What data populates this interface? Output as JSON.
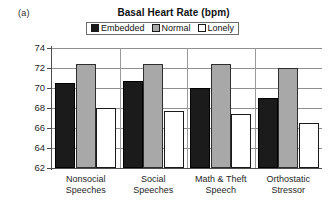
{
  "panel": {
    "label": "(a)"
  },
  "legend": {
    "position": "top-center",
    "entries": [
      {
        "label": "Embedded",
        "color": "#1b1b1b",
        "swatch": "filled-black-square-icon"
      },
      {
        "label": "Normal",
        "color": "#a8a8a8",
        "swatch": "filled-gray-square-icon"
      },
      {
        "label": "Lonely",
        "color": "#ffffff",
        "swatch": "empty-white-square-icon"
      }
    ]
  },
  "chart_data": {
    "type": "bar",
    "title": "Basal Heart Rate (bpm)",
    "xlabel": "",
    "ylabel": "",
    "ylim": [
      62,
      74
    ],
    "yticks": [
      62,
      64,
      66,
      68,
      70,
      72,
      74
    ],
    "ytick_labels": [
      "62",
      "64",
      "66",
      "68",
      "70",
      "72",
      "74"
    ],
    "grid": true,
    "grid_axis": "y",
    "categories": [
      "Nonsocial Speeches",
      "Social Speeches",
      "Math & Theft Speech",
      "Orthostatic Stressor"
    ],
    "category_lines": [
      [
        "Nonsocial",
        "Speeches"
      ],
      [
        "Social",
        "Speeches"
      ],
      [
        "Math & Theft",
        "Speech"
      ],
      [
        "Orthostatic",
        "Stressor"
      ]
    ],
    "series": [
      {
        "name": "Embedded",
        "color": "#1b1b1b",
        "values": [
          70.5,
          70.7,
          70.0,
          69.0
        ]
      },
      {
        "name": "Normal",
        "color": "#a8a8a8",
        "values": [
          72.4,
          72.4,
          72.4,
          72.0
        ]
      },
      {
        "name": "Lonely",
        "color": "#ffffff",
        "values": [
          68.0,
          67.7,
          67.4,
          66.5
        ]
      }
    ]
  }
}
